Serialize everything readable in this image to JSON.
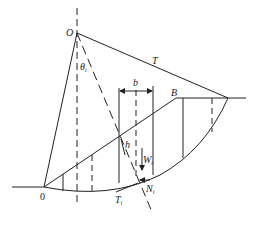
{
  "diagram": {
    "type": "slope-stability-slice-method",
    "labels": {
      "center": "O",
      "angle": "θ",
      "angle_sub": "i",
      "tension": "T",
      "slice_width": "b",
      "crest": "B",
      "toe": "0",
      "height": "h",
      "weight": "W",
      "weight_sub": "i",
      "normal": "N",
      "normal_sub": "i",
      "shear": "T",
      "shear_sub": "i"
    },
    "colors": {
      "stroke": "#222222",
      "background": "#ffffff"
    }
  }
}
